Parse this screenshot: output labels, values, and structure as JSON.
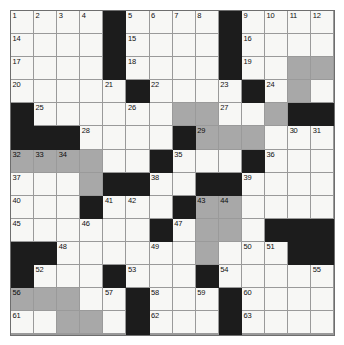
{
  "puzzle": {
    "type": "crossword-grid",
    "rows": 14,
    "columns": 14,
    "cell_size_px": 23,
    "colors": {
      "white_cell": "#f7f7f5",
      "shaded_cell": "#a8a8a8",
      "block_cell": "#1c1c1c",
      "grid_line": "#9a9a9a",
      "border": "#6e6e6e",
      "number_text": "#111111",
      "page_background": "#ffffff"
    },
    "legend": {
      "white": "open answer square",
      "gray": "shaded answer square",
      "black": "blocked square"
    },
    "clue_numbers_present": [
      1,
      2,
      3,
      4,
      5,
      6,
      7,
      8,
      9,
      10,
      11,
      12,
      13,
      14,
      15,
      16,
      17,
      18,
      19,
      20,
      21,
      22,
      23,
      24,
      25,
      26,
      27,
      28,
      29,
      30,
      31,
      32,
      33,
      34,
      35,
      36,
      37,
      38,
      39,
      40,
      41,
      42,
      43,
      44,
      45,
      46,
      47,
      48,
      49,
      50,
      51,
      52,
      53,
      54,
      55,
      56,
      57,
      58,
      59,
      60,
      61,
      62,
      63,
      64,
      65,
      66
    ],
    "grid": [
      [
        {
          "s": "white",
          "n": "1"
        },
        {
          "s": "white",
          "n": "2"
        },
        {
          "s": "white",
          "n": "3"
        },
        {
          "s": "white",
          "n": "4"
        },
        {
          "s": "black",
          "n": ""
        },
        {
          "s": "white",
          "n": "5"
        },
        {
          "s": "white",
          "n": "6"
        },
        {
          "s": "white",
          "n": "7"
        },
        {
          "s": "white",
          "n": "8"
        },
        {
          "s": "black",
          "n": ""
        },
        {
          "s": "white",
          "n": "9"
        },
        {
          "s": "white",
          "n": "10"
        },
        {
          "s": "white",
          "n": "11"
        },
        {
          "s": "white",
          "n": "12"
        }
      ],
      [
        {
          "s": "white",
          "n": "14"
        },
        {
          "s": "white",
          "n": ""
        },
        {
          "s": "white",
          "n": ""
        },
        {
          "s": "white",
          "n": ""
        },
        {
          "s": "black",
          "n": ""
        },
        {
          "s": "white",
          "n": "15"
        },
        {
          "s": "white",
          "n": ""
        },
        {
          "s": "white",
          "n": ""
        },
        {
          "s": "white",
          "n": ""
        },
        {
          "s": "black",
          "n": ""
        },
        {
          "s": "white",
          "n": "16"
        },
        {
          "s": "white",
          "n": ""
        },
        {
          "s": "white",
          "n": ""
        },
        {
          "s": "white",
          "n": ""
        }
      ],
      [
        {
          "s": "white",
          "n": "17"
        },
        {
          "s": "white",
          "n": ""
        },
        {
          "s": "white",
          "n": ""
        },
        {
          "s": "white",
          "n": ""
        },
        {
          "s": "black",
          "n": ""
        },
        {
          "s": "white",
          "n": "18"
        },
        {
          "s": "white",
          "n": ""
        },
        {
          "s": "white",
          "n": ""
        },
        {
          "s": "white",
          "n": ""
        },
        {
          "s": "black",
          "n": ""
        },
        {
          "s": "white",
          "n": "19"
        },
        {
          "s": "white",
          "n": ""
        },
        {
          "s": "gray",
          "n": ""
        },
        {
          "s": "gray",
          "n": ""
        }
      ],
      [
        {
          "s": "white",
          "n": "20"
        },
        {
          "s": "white",
          "n": ""
        },
        {
          "s": "white",
          "n": ""
        },
        {
          "s": "white",
          "n": ""
        },
        {
          "s": "white",
          "n": "21"
        },
        {
          "s": "black",
          "n": ""
        },
        {
          "s": "white",
          "n": "22"
        },
        {
          "s": "white",
          "n": ""
        },
        {
          "s": "white",
          "n": ""
        },
        {
          "s": "white",
          "n": "23"
        },
        {
          "s": "black",
          "n": ""
        },
        {
          "s": "white",
          "n": "24"
        },
        {
          "s": "gray",
          "n": ""
        },
        {
          "s": "white",
          "n": ""
        }
      ],
      [
        {
          "s": "black",
          "n": ""
        },
        {
          "s": "white",
          "n": "25"
        },
        {
          "s": "white",
          "n": ""
        },
        {
          "s": "white",
          "n": ""
        },
        {
          "s": "white",
          "n": ""
        },
        {
          "s": "white",
          "n": "26"
        },
        {
          "s": "white",
          "n": ""
        },
        {
          "s": "gray",
          "n": ""
        },
        {
          "s": "gray",
          "n": ""
        },
        {
          "s": "white",
          "n": "27"
        },
        {
          "s": "white",
          "n": ""
        },
        {
          "s": "gray",
          "n": ""
        },
        {
          "s": "black",
          "n": ""
        },
        {
          "s": "black",
          "n": ""
        }
      ],
      [
        {
          "s": "black",
          "n": ""
        },
        {
          "s": "black",
          "n": ""
        },
        {
          "s": "black",
          "n": ""
        },
        {
          "s": "white",
          "n": "28"
        },
        {
          "s": "white",
          "n": ""
        },
        {
          "s": "white",
          "n": ""
        },
        {
          "s": "white",
          "n": ""
        },
        {
          "s": "black",
          "n": ""
        },
        {
          "s": "gray",
          "n": "29"
        },
        {
          "s": "gray",
          "n": ""
        },
        {
          "s": "gray",
          "n": ""
        },
        {
          "s": "white",
          "n": ""
        },
        {
          "s": "white",
          "n": "30"
        },
        {
          "s": "white",
          "n": "31"
        }
      ],
      [
        {
          "s": "gray",
          "n": "32"
        },
        {
          "s": "gray",
          "n": "33"
        },
        {
          "s": "gray",
          "n": "34"
        },
        {
          "s": "gray",
          "n": ""
        },
        {
          "s": "white",
          "n": ""
        },
        {
          "s": "white",
          "n": ""
        },
        {
          "s": "black",
          "n": ""
        },
        {
          "s": "white",
          "n": "35"
        },
        {
          "s": "white",
          "n": ""
        },
        {
          "s": "white",
          "n": ""
        },
        {
          "s": "black",
          "n": ""
        },
        {
          "s": "white",
          "n": "36"
        },
        {
          "s": "white",
          "n": ""
        },
        {
          "s": "white",
          "n": ""
        }
      ],
      [
        {
          "s": "white",
          "n": "37"
        },
        {
          "s": "white",
          "n": ""
        },
        {
          "s": "white",
          "n": ""
        },
        {
          "s": "gray",
          "n": ""
        },
        {
          "s": "black",
          "n": ""
        },
        {
          "s": "black",
          "n": ""
        },
        {
          "s": "white",
          "n": "38"
        },
        {
          "s": "white",
          "n": ""
        },
        {
          "s": "black",
          "n": ""
        },
        {
          "s": "black",
          "n": ""
        },
        {
          "s": "white",
          "n": "39"
        },
        {
          "s": "white",
          "n": ""
        },
        {
          "s": "white",
          "n": ""
        },
        {
          "s": "white",
          "n": ""
        }
      ],
      [
        {
          "s": "white",
          "n": "40"
        },
        {
          "s": "white",
          "n": ""
        },
        {
          "s": "white",
          "n": ""
        },
        {
          "s": "black",
          "n": ""
        },
        {
          "s": "white",
          "n": "41"
        },
        {
          "s": "white",
          "n": "42"
        },
        {
          "s": "white",
          "n": ""
        },
        {
          "s": "black",
          "n": ""
        },
        {
          "s": "gray",
          "n": "43"
        },
        {
          "s": "gray",
          "n": "44"
        },
        {
          "s": "white",
          "n": ""
        },
        {
          "s": "white",
          "n": ""
        },
        {
          "s": "white",
          "n": ""
        },
        {
          "s": "white",
          "n": ""
        }
      ],
      [
        {
          "s": "white",
          "n": "45"
        },
        {
          "s": "white",
          "n": ""
        },
        {
          "s": "white",
          "n": ""
        },
        {
          "s": "white",
          "n": "46"
        },
        {
          "s": "white",
          "n": ""
        },
        {
          "s": "white",
          "n": ""
        },
        {
          "s": "black",
          "n": ""
        },
        {
          "s": "white",
          "n": "47"
        },
        {
          "s": "gray",
          "n": ""
        },
        {
          "s": "gray",
          "n": ""
        },
        {
          "s": "white",
          "n": ""
        },
        {
          "s": "black",
          "n": ""
        },
        {
          "s": "black",
          "n": ""
        },
        {
          "s": "black",
          "n": ""
        }
      ],
      [
        {
          "s": "black",
          "n": ""
        },
        {
          "s": "black",
          "n": ""
        },
        {
          "s": "white",
          "n": "48"
        },
        {
          "s": "white",
          "n": ""
        },
        {
          "s": "white",
          "n": ""
        },
        {
          "s": "white",
          "n": ""
        },
        {
          "s": "white",
          "n": "49"
        },
        {
          "s": "white",
          "n": ""
        },
        {
          "s": "gray",
          "n": ""
        },
        {
          "s": "white",
          "n": ""
        },
        {
          "s": "white",
          "n": "50"
        },
        {
          "s": "white",
          "n": "51"
        },
        {
          "s": "black",
          "n": ""
        },
        {
          "s": "black",
          "n": ""
        }
      ],
      [
        {
          "s": "black",
          "n": ""
        },
        {
          "s": "white",
          "n": "52"
        },
        {
          "s": "white",
          "n": ""
        },
        {
          "s": "white",
          "n": ""
        },
        {
          "s": "black",
          "n": ""
        },
        {
          "s": "white",
          "n": "53"
        },
        {
          "s": "white",
          "n": ""
        },
        {
          "s": "white",
          "n": ""
        },
        {
          "s": "black",
          "n": ""
        },
        {
          "s": "white",
          "n": "54"
        },
        {
          "s": "white",
          "n": ""
        },
        {
          "s": "white",
          "n": ""
        },
        {
          "s": "white",
          "n": ""
        },
        {
          "s": "white",
          "n": "55"
        }
      ],
      [
        {
          "s": "gray",
          "n": "56"
        },
        {
          "s": "gray",
          "n": ""
        },
        {
          "s": "gray",
          "n": ""
        },
        {
          "s": "white",
          "n": ""
        },
        {
          "s": "white",
          "n": "57"
        },
        {
          "s": "black",
          "n": ""
        },
        {
          "s": "white",
          "n": "58"
        },
        {
          "s": "white",
          "n": ""
        },
        {
          "s": "white",
          "n": "59"
        },
        {
          "s": "black",
          "n": ""
        },
        {
          "s": "white",
          "n": "60"
        },
        {
          "s": "white",
          "n": ""
        },
        {
          "s": "white",
          "n": ""
        },
        {
          "s": "white",
          "n": ""
        }
      ],
      [
        {
          "s": "white",
          "n": "61"
        },
        {
          "s": "white",
          "n": ""
        },
        {
          "s": "gray",
          "n": ""
        },
        {
          "s": "gray",
          "n": ""
        },
        {
          "s": "white",
          "n": ""
        },
        {
          "s": "black",
          "n": ""
        },
        {
          "s": "white",
          "n": "62"
        },
        {
          "s": "white",
          "n": ""
        },
        {
          "s": "white",
          "n": ""
        },
        {
          "s": "black",
          "n": ""
        },
        {
          "s": "white",
          "n": "63"
        },
        {
          "s": "white",
          "n": ""
        },
        {
          "s": "white",
          "n": ""
        },
        {
          "s": "white",
          "n": ""
        }
      ],
      [
        {
          "s": "white",
          "n": "64"
        },
        {
          "s": "white",
          "n": ""
        },
        {
          "s": "white",
          "n": ""
        },
        {
          "s": "white",
          "n": ""
        },
        {
          "s": "white",
          "n": ""
        },
        {
          "s": "black",
          "n": ""
        },
        {
          "s": "white",
          "n": "65"
        },
        {
          "s": "white",
          "n": ""
        },
        {
          "s": "white",
          "n": ""
        },
        {
          "s": "black",
          "n": ""
        },
        {
          "s": "white",
          "n": "66"
        },
        {
          "s": "white",
          "n": ""
        },
        {
          "s": "white",
          "n": ""
        },
        {
          "s": "white",
          "n": ""
        }
      ]
    ]
  }
}
